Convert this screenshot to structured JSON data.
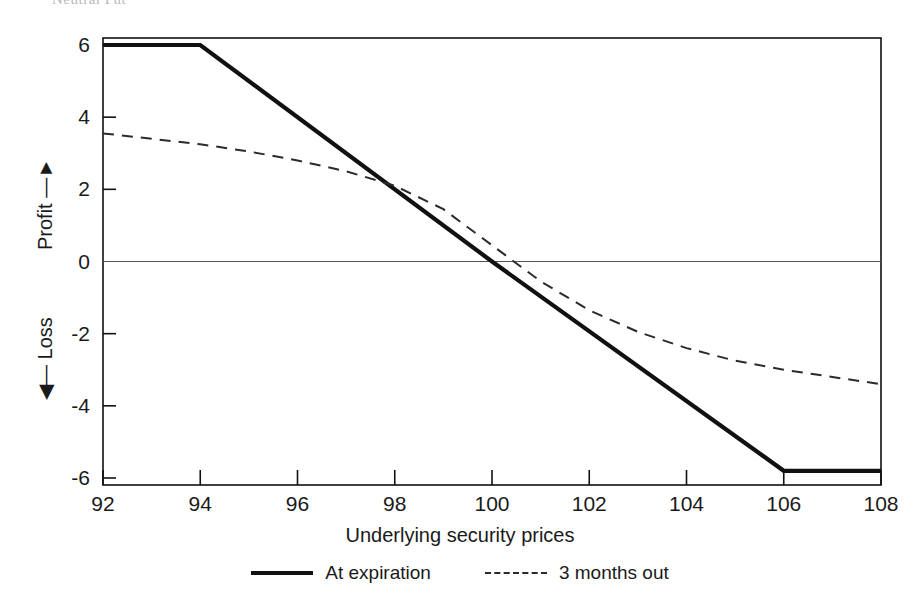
{
  "page": {
    "clipped_header_text": "Neutral Put"
  },
  "chart_data": {
    "type": "line",
    "title": "",
    "xlabel": "Underlying security prices",
    "ylabel": "Profit / Loss",
    "ylabel_positive": "Profit",
    "ylabel_negative": "Loss",
    "xlim": [
      92,
      108
    ],
    "ylim": [
      -6,
      6
    ],
    "xticks": [
      92,
      94,
      96,
      98,
      100,
      102,
      104,
      106,
      108
    ],
    "yticks": [
      6,
      4,
      2,
      0,
      -2,
      -4,
      -6
    ],
    "xtick_labels": [
      "92",
      "94",
      "96",
      "98",
      "100",
      "102",
      "104",
      "106",
      "108"
    ],
    "ytick_labels": [
      "6",
      "4",
      "2",
      "0",
      "-2",
      "-4",
      "-6"
    ],
    "grid": false,
    "zero_line": true,
    "legend_position": "below-plot",
    "series": [
      {
        "name": "At expiration",
        "style": "solid",
        "color": "#111111",
        "x": [
          92,
          94,
          100,
          106,
          108
        ],
        "values": [
          6,
          6,
          0,
          -5.8,
          -5.8
        ]
      },
      {
        "name": "3 months out",
        "style": "dashed",
        "color": "#2b2b2b",
        "x": [
          92,
          93,
          94,
          95,
          96,
          97,
          98,
          99,
          100,
          101,
          102,
          103,
          104,
          105,
          106,
          107,
          108
        ],
        "values": [
          3.55,
          3.4,
          3.25,
          3.05,
          2.8,
          2.5,
          2.1,
          1.45,
          0.45,
          -0.55,
          -1.35,
          -1.95,
          -2.4,
          -2.75,
          -3.0,
          -3.2,
          -3.4
        ]
      }
    ]
  },
  "legend": {
    "entries": [
      {
        "label": "At expiration",
        "style": "solid"
      },
      {
        "label": "3 months out",
        "style": "dashed"
      }
    ]
  },
  "colors": {
    "axis": "#111111",
    "expiration_line": "#111111",
    "three_months_line": "#2b2b2b",
    "zero_line": "#555555",
    "background": "#ffffff"
  }
}
